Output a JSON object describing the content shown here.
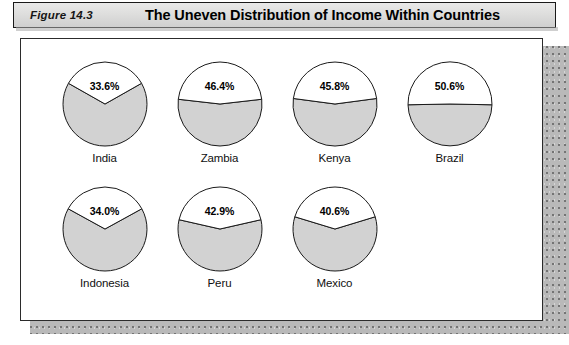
{
  "header": {
    "figure_label": "Figure 14.3",
    "title": "The Uneven Distribution of Income  Within Countries"
  },
  "style": {
    "slice_fill": "#d2d2d2",
    "slice_highlight_fill": "#ffffff",
    "stroke": "#1a1a1a",
    "panel_background": "#ffffff",
    "titlebar_background": "#dedede"
  },
  "chart_data": {
    "type": "pie",
    "title": "The Uneven Distribution of Income  Within Countries",
    "xlabel": "",
    "ylabel": "",
    "legend": "none",
    "note": "Each pie shows the share of national income received by the richest fifth (white, labeled) versus the remainder (gray).",
    "charts": [
      {
        "label": "India",
        "value": 33.6,
        "value_text": "33.6%",
        "remainder": 66.4,
        "row": 0,
        "col": 0
      },
      {
        "label": "Zambia",
        "value": 46.4,
        "value_text": "46.4%",
        "remainder": 53.6,
        "row": 0,
        "col": 1
      },
      {
        "label": "Kenya",
        "value": 45.8,
        "value_text": "45.8%",
        "remainder": 54.2,
        "row": 0,
        "col": 2
      },
      {
        "label": "Brazil",
        "value": 50.6,
        "value_text": "50.6%",
        "remainder": 49.4,
        "row": 0,
        "col": 3
      },
      {
        "label": "Indonesia",
        "value": 34.0,
        "value_text": "34.0%",
        "remainder": 66.0,
        "row": 1,
        "col": 0
      },
      {
        "label": "Peru",
        "value": 42.9,
        "value_text": "42.9%",
        "remainder": 57.1,
        "row": 1,
        "col": 1
      },
      {
        "label": "Mexico",
        "value": 40.6,
        "value_text": "40.6%",
        "remainder": 59.4,
        "row": 1,
        "col": 2
      }
    ]
  }
}
